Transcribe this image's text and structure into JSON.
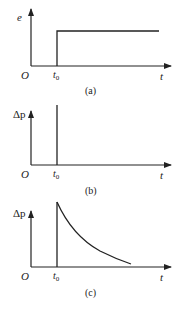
{
  "panels": [
    {
      "id": "a",
      "caption": "(a)",
      "y_label": "e",
      "x_label": "t",
      "origin_label": "O",
      "t0_label": "t",
      "t0_sub": "0",
      "description": "step function rising at t0"
    },
    {
      "id": "b",
      "caption": "(b)",
      "y_label": "Δp",
      "x_label": "t",
      "origin_label": "O",
      "t0_label": "t",
      "t0_sub": "0",
      "description": "impulse at t0"
    },
    {
      "id": "c",
      "caption": "(c)",
      "y_label": "Δp",
      "x_label": "t",
      "origin_label": "O",
      "t0_label": "t",
      "t0_sub": "0",
      "description": "jump at t0 followed by exponential decay"
    }
  ],
  "colors": {
    "line": "#222222",
    "background": "#ffffff"
  }
}
